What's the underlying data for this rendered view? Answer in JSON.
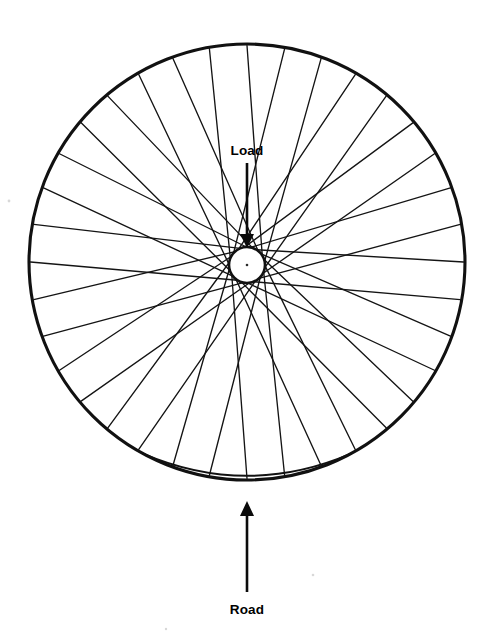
{
  "figure": {
    "kind": "technical-line-diagram",
    "background_color": "#ffffff",
    "ink_color": "#111111",
    "width": 494,
    "height": 642
  },
  "wheel": {
    "rim": {
      "label": "rim",
      "center_x": 247,
      "center_y": 262,
      "radius": 218,
      "stroke_width": 3.1,
      "color": "#111111"
    },
    "rim_deflection": {
      "label": "flattened contact patch",
      "sag_depth": 9,
      "half_width": 104,
      "stroke_width": 2.0,
      "color": "#111111"
    },
    "hub": {
      "label": "hub",
      "center_x": 247,
      "center_y": 265,
      "radius": 18,
      "stroke_width": 2.6,
      "color": "#111111",
      "center_dot_radius": 1.3
    },
    "spokes": {
      "label": "spokes",
      "count": 36,
      "lacing": "tangential",
      "cross_pattern": 3,
      "tangent_offset_deg": 58,
      "stroke_width": 1.35,
      "color": "#141414"
    }
  },
  "callouts": [
    {
      "id": "load",
      "label": "Load",
      "label_x": 247,
      "label_y": 155,
      "direction": "down",
      "shaft_x": 247,
      "shaft_from_y": 163,
      "shaft_to_y": 238,
      "head_tip_y": 248,
      "head_half_width": 7,
      "head_length": 14
    },
    {
      "id": "road",
      "label": "Road",
      "label_x": 247,
      "label_y": 614,
      "direction": "up",
      "shaft_x": 247,
      "shaft_from_y": 592,
      "shaft_to_y": 516,
      "head_tip_y": 501,
      "head_half_width": 7,
      "head_length": 15
    }
  ],
  "specks": [
    {
      "x": 9,
      "y": 201,
      "r": 1.4
    },
    {
      "x": 313,
      "y": 575,
      "r": 1.3
    },
    {
      "x": 166,
      "y": 629,
      "r": 1.2
    }
  ]
}
